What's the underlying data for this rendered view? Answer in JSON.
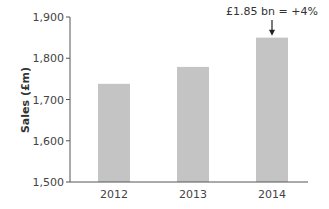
{
  "chart_data": {
    "type": "bar",
    "title": "",
    "xlabel": "",
    "ylabel": "Sales (£m)",
    "categories": [
      "2012",
      "2013",
      "2014"
    ],
    "values": [
      1738,
      1779,
      1850
    ],
    "ylim": [
      1500,
      1900
    ],
    "yticks": [
      1500,
      1600,
      1700,
      1800,
      1900
    ],
    "ytick_labels": [
      "1,500",
      "1,600",
      "1,700",
      "1,800",
      "1,900"
    ],
    "grid": false,
    "bar_color": "#c4c4c4",
    "axis_color": "#555555",
    "annotations": [
      {
        "target": "2014",
        "text": "£1.85 bn = +4%",
        "arrow": "down"
      }
    ]
  }
}
